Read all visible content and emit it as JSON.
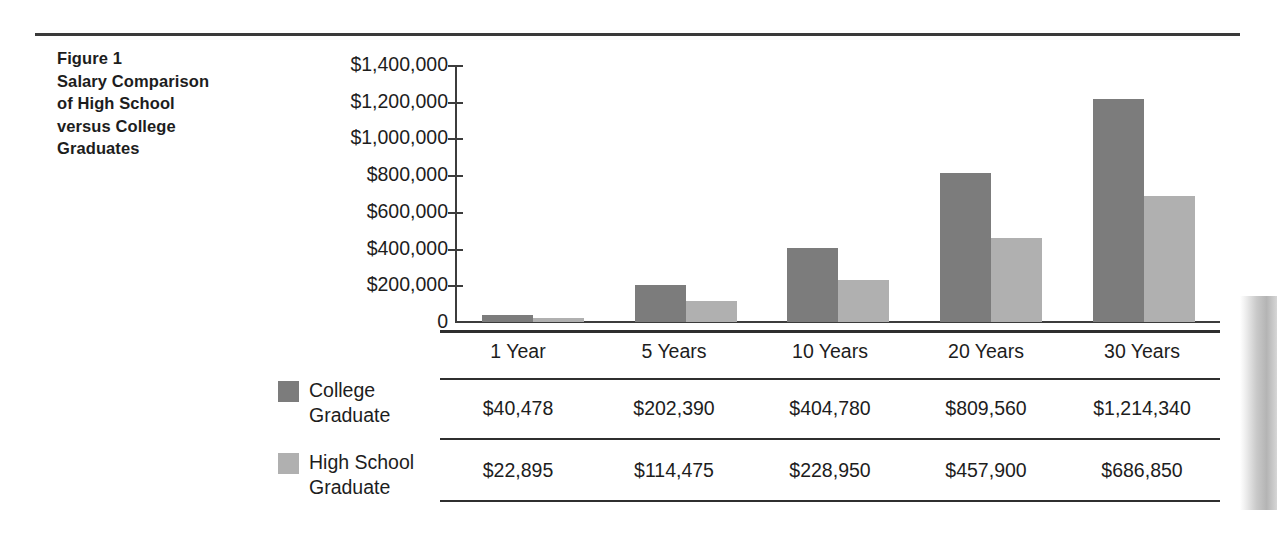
{
  "caption": {
    "lines": [
      "Figure 1",
      "Salary Comparison",
      "of High School",
      "versus College",
      "Graduates"
    ]
  },
  "legend": {
    "items": [
      {
        "label_line1": "College",
        "label_line2": "Graduate",
        "color": "#7c7c7c",
        "name": "college-graduate"
      },
      {
        "label_line1": "High School",
        "label_line2": "Graduate",
        "color": "#b0b0b0",
        "name": "high-school-graduate"
      }
    ]
  },
  "table": {
    "header": [
      "1 Year",
      "5 Years",
      "10 Years",
      "20 Years",
      "30 Years"
    ],
    "rows": [
      {
        "series": "College Graduate",
        "values": [
          "$40,478",
          "$202,390",
          "$404,780",
          "$809,560",
          "$1,214,340"
        ]
      },
      {
        "series": "High School Graduate",
        "values": [
          "$22,895",
          "$114,475",
          "$228,950",
          "$457,900",
          "$686,850"
        ]
      }
    ]
  },
  "axis": {
    "yticks": [
      "$1,400,000",
      "$1,200,000",
      "$1,000,000",
      "$800,000",
      "$600,000",
      "$400,000",
      "$200,000",
      "0"
    ]
  },
  "chart_data": {
    "type": "bar",
    "title": "Figure 1 Salary Comparison of High School versus College Graduates",
    "xlabel": "",
    "ylabel": "",
    "categories": [
      "1 Year",
      "5 Years",
      "10 Years",
      "20 Years",
      "30 Years"
    ],
    "series": [
      {
        "name": "College Graduate",
        "color": "#7c7c7c",
        "values": [
          40478,
          202390,
          404780,
          809560,
          1214340
        ]
      },
      {
        "name": "High School Graduate",
        "color": "#b0b0b0",
        "values": [
          22895,
          114475,
          228950,
          457900,
          686850
        ]
      }
    ],
    "ylim": [
      0,
      1400000
    ],
    "ytick_step": 200000,
    "ytick_labels": [
      "0",
      "$200,000",
      "$400,000",
      "$600,000",
      "$800,000",
      "$1,000,000",
      "$1,200,000",
      "$1,400,000"
    ],
    "grid": false,
    "legend_position": "below-left"
  }
}
